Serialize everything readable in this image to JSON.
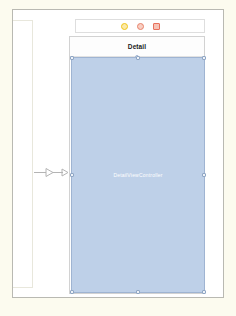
{
  "app": {
    "name": "Xcode Interface Builder",
    "editor": "storyboard-canvas"
  },
  "canvas": {
    "background_color": "#ffffff",
    "margin_color": "#fcfbef",
    "border_color": "#b9b9b2"
  },
  "neighbor_scene": {
    "name": "adjacent-scene-outline",
    "visible": true
  },
  "segue": {
    "name": "show-segue",
    "direction": "right",
    "label": ""
  },
  "scene": {
    "title": "Detail",
    "dock": {
      "items": [
        {
          "icon": "view-controller-icon",
          "label": "View Controller",
          "color": "#f0c419",
          "shape": "circle"
        },
        {
          "icon": "first-responder-icon",
          "label": "First Responder",
          "color": "#e8826b",
          "shape": "circle"
        },
        {
          "icon": "exit-icon",
          "label": "Exit",
          "color": "#e8705c",
          "shape": "square"
        }
      ]
    },
    "nav_bar": {
      "title": "Detail"
    },
    "selected_view": {
      "label": "DetailViewController",
      "fill_color": "#bed0e8",
      "stroke_color": "#9fb4d2",
      "selected": true,
      "handle_fill": "#eef2f8",
      "handle_stroke": "#8fa6c4"
    }
  }
}
